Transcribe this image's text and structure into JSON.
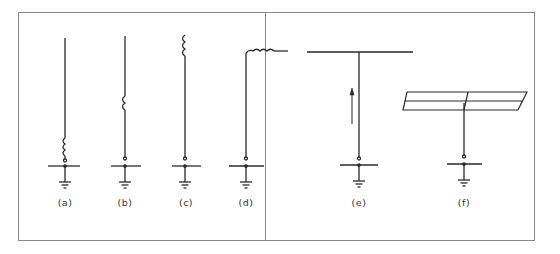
{
  "figure": {
    "frame_color": "#8a8a8a",
    "line_color": "#2a2a2a",
    "background": "#ffffff"
  },
  "panels": [
    {
      "id": "a",
      "label": "(a)",
      "description": "Vertical monopole with base-loading coil above feed"
    },
    {
      "id": "b",
      "label": "(b)",
      "description": "Vertical monopole with center-loading coil"
    },
    {
      "id": "c",
      "label": "(c)",
      "description": "Vertical monopole with top-loading coil"
    },
    {
      "id": "d",
      "label": "(d)",
      "description": "Inverted-L antenna with coil in horizontal section"
    },
    {
      "id": "e",
      "label": "(e)",
      "description": "T-antenna with horizontal top wire and upward current arrow"
    },
    {
      "id": "f",
      "label": "(f)",
      "description": "Monopole with capacitive top-hat plate"
    }
  ]
}
